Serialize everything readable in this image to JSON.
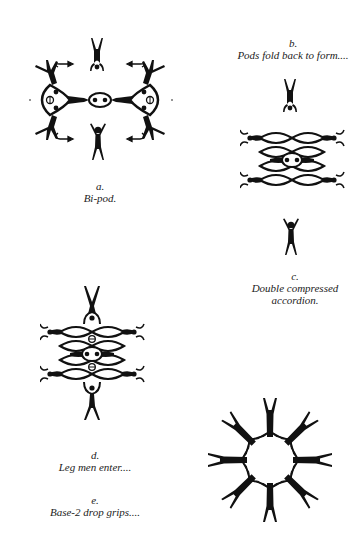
{
  "figures": [
    {
      "id": "a",
      "letter": "a.",
      "caption": "Bi-pod."
    },
    {
      "id": "b",
      "letter": "b.",
      "caption": "Pods fold back to form...."
    },
    {
      "id": "c",
      "letter": "c.",
      "caption_line1": "Double compressed",
      "caption_line2": "accordion."
    },
    {
      "id": "d",
      "letter": "d.",
      "caption": "Leg men enter...."
    },
    {
      "id": "e",
      "letter": "e.",
      "caption": "Base-2 drop grips...."
    }
  ],
  "colors": {
    "ink": "#111111",
    "paper": "#ffffff"
  }
}
